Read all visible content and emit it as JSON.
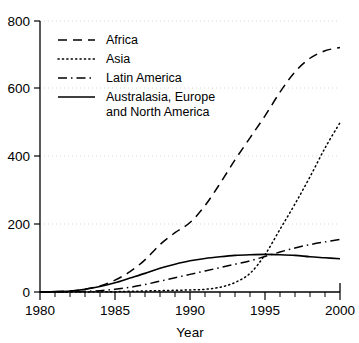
{
  "chart_data": {
    "type": "line",
    "title": "",
    "subtitle": "",
    "xlabel": "Year",
    "ylabel": "",
    "xlim": [
      1980,
      2000
    ],
    "ylim": [
      0,
      800
    ],
    "xticks": [
      1980,
      1985,
      1990,
      1995,
      2000
    ],
    "xtick_labels": [
      "1980",
      "1985",
      "1990",
      "1995",
      "2000"
    ],
    "x_minor_tick_step": 1,
    "yticks": [
      0,
      200,
      400,
      600,
      800
    ],
    "ytick_labels": [
      "0",
      "200",
      "400",
      "600",
      "800"
    ],
    "grid": "horizontal-dotted-faint",
    "legend_position": "upper-left-inside",
    "x": [
      1980,
      1981,
      1982,
      1983,
      1984,
      1985,
      1986,
      1987,
      1988,
      1989,
      1990,
      1991,
      1992,
      1993,
      1994,
      1995,
      1996,
      1997,
      1998,
      1999,
      2000
    ],
    "series": [
      {
        "name": "Africa",
        "style": "dashed",
        "values": [
          0,
          1,
          3,
          8,
          18,
          35,
          60,
          95,
          140,
          175,
          205,
          255,
          320,
          390,
          455,
          520,
          590,
          650,
          690,
          712,
          722
        ]
      },
      {
        "name": "Asia",
        "style": "dotted",
        "values": [
          0,
          0,
          0,
          0,
          1,
          1,
          2,
          3,
          4,
          5,
          6,
          8,
          14,
          28,
          55,
          110,
          185,
          260,
          340,
          425,
          500
        ]
      },
      {
        "name": "Latin America",
        "style": "dash-dot",
        "values": [
          0,
          0,
          1,
          2,
          4,
          8,
          14,
          22,
          32,
          42,
          52,
          62,
          72,
          82,
          92,
          105,
          118,
          130,
          140,
          148,
          155
        ]
      },
      {
        "name": "Australasia, Europe and North America",
        "style": "solid",
        "values": [
          0,
          1,
          3,
          8,
          16,
          27,
          41,
          55,
          70,
          82,
          92,
          99,
          104,
          108,
          110,
          111,
          110,
          108,
          104,
          101,
          98
        ]
      }
    ],
    "legend": [
      {
        "label": "Africa",
        "style": "dashed"
      },
      {
        "label": "Asia",
        "style": "dotted"
      },
      {
        "label": "Latin America",
        "style": "dash-dot"
      },
      {
        "label_line1": "Australasia, Europe",
        "label_line2": "and North America",
        "style": "solid"
      }
    ]
  }
}
